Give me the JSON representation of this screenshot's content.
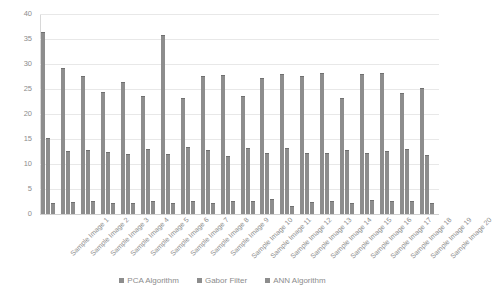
{
  "chart_data": {
    "type": "bar",
    "title": "",
    "subtitle": "",
    "xlabel": "",
    "ylabel": "",
    "ylim": [
      0,
      40
    ],
    "yticks": [
      0,
      5,
      10,
      15,
      20,
      25,
      30,
      35,
      40
    ],
    "grid": true,
    "legend_position": "bottom",
    "bar_color": "#8d8d8d",
    "categories": [
      "Sample Image 1",
      "Sample Image 2",
      "Sample Image 3",
      "Sample Image 4",
      "Sample Image 5",
      "Sample Image 6",
      "Sample Image 7",
      "Sample Image 8",
      "Sample Image 9",
      "Sample Image 10",
      "Sample Image 11",
      "Sample Image 12",
      "Sample Image 13",
      "Sample Image 14",
      "Sample Image 15",
      "Sample Image 16",
      "Sample Image 17",
      "Sample Image 18",
      "Sample Image 19",
      "Sample Image 20"
    ],
    "series": [
      {
        "name": "PCA Algorithm",
        "values": [
          36.5,
          29.3,
          27.7,
          24.4,
          26.5,
          23.7,
          35.8,
          23.3,
          27.6,
          27.8,
          23.7,
          27.2,
          28.1,
          27.6,
          28.3,
          23.2,
          28.1,
          28.3,
          24.3,
          25.3
        ]
      },
      {
        "name": "Gabor Filter",
        "values": [
          15.3,
          12.6,
          12.8,
          12.4,
          12.1,
          13.1,
          12.1,
          13.5,
          12.8,
          11.7,
          13.2,
          12.3,
          13.3,
          12.2,
          12.3,
          12.8,
          12.3,
          12.7,
          13.0,
          11.9
        ]
      },
      {
        "name": "ANN Algorithm",
        "values": [
          2.3,
          2.5,
          2.7,
          2.3,
          2.2,
          2.6,
          2.2,
          2.6,
          2.2,
          2.7,
          2.6,
          3.0,
          1.6,
          2.4,
          2.6,
          2.2,
          2.8,
          2.6,
          2.6,
          2.3
        ]
      }
    ]
  },
  "legend": {
    "items": [
      {
        "label": "PCA Algorithm"
      },
      {
        "label": "Gabor Filter"
      },
      {
        "label": "ANN Algorithm"
      }
    ]
  }
}
